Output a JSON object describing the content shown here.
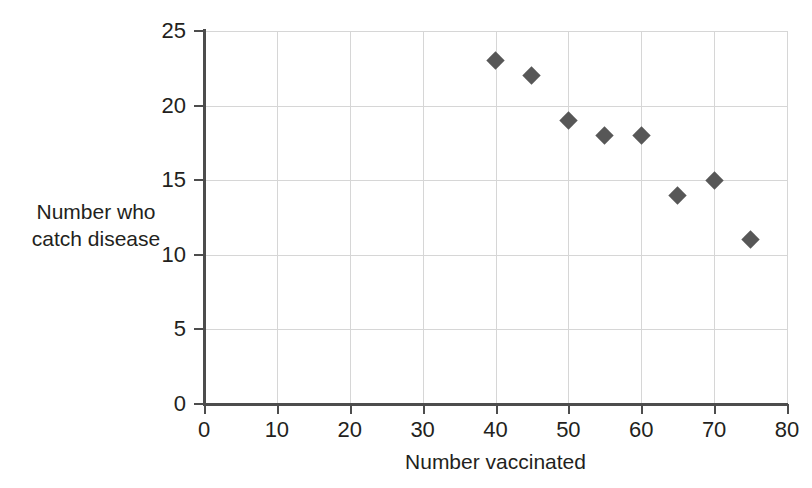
{
  "chart_data": {
    "type": "scatter",
    "title": "",
    "subtitle": "",
    "xlabel": "Number vaccinated",
    "ylabel": "Number who catch disease",
    "ylabel_lines": [
      "Number who",
      "catch disease"
    ],
    "xlim": [
      0,
      80
    ],
    "ylim": [
      0,
      25
    ],
    "xticks": [
      0,
      10,
      20,
      30,
      40,
      50,
      60,
      70,
      80
    ],
    "yticks": [
      0,
      5,
      10,
      15,
      20,
      25
    ],
    "xtick_labels": [
      "0",
      "10",
      "20",
      "30",
      "40",
      "50",
      "60",
      "70",
      "80"
    ],
    "ytick_labels": [
      "0",
      "5",
      "10",
      "15",
      "20",
      "25"
    ],
    "grid": true,
    "legend": "none",
    "marker": "diamond",
    "marker_color": "#575757",
    "grid_color": "#d6d6d6",
    "axis_color": "#4d4d4d",
    "background_color": "#ffffff",
    "x": [
      40,
      45,
      50,
      55,
      60,
      65,
      70,
      75
    ],
    "y": [
      23,
      22,
      19,
      18,
      18,
      14,
      15,
      11
    ],
    "points": [
      {
        "x": 40,
        "y": 23
      },
      {
        "x": 45,
        "y": 22
      },
      {
        "x": 50,
        "y": 19
      },
      {
        "x": 55,
        "y": 18
      },
      {
        "x": 60,
        "y": 18
      },
      {
        "x": 65,
        "y": 14
      },
      {
        "x": 70,
        "y": 15
      },
      {
        "x": 75,
        "y": 11
      }
    ]
  }
}
